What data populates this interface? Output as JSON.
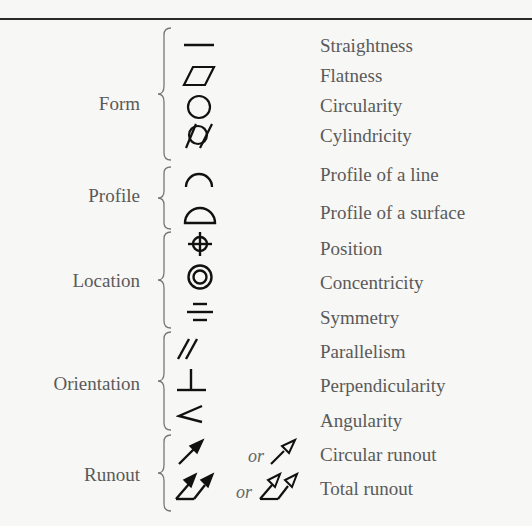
{
  "diagram": {
    "categories": [
      {
        "label": "Form",
        "items": [
          {
            "symbol": "straightness-icon",
            "name": "Straightness"
          },
          {
            "symbol": "flatness-icon",
            "name": "Flatness"
          },
          {
            "symbol": "circularity-icon",
            "name": "Circularity"
          },
          {
            "symbol": "cylindricity-icon",
            "name": "Cylindricity"
          }
        ]
      },
      {
        "label": "Profile",
        "items": [
          {
            "symbol": "profile-line-icon",
            "name": "Profile of a line"
          },
          {
            "symbol": "profile-surface-icon",
            "name": "Profile of a surface"
          }
        ]
      },
      {
        "label": "Location",
        "items": [
          {
            "symbol": "position-icon",
            "name": "Position"
          },
          {
            "symbol": "concentricity-icon",
            "name": "Concentricity"
          },
          {
            "symbol": "symmetry-icon",
            "name": "Symmetry"
          }
        ]
      },
      {
        "label": "Orientation",
        "items": [
          {
            "symbol": "parallelism-icon",
            "name": "Parallelism"
          },
          {
            "symbol": "perpendicularity-icon",
            "name": "Perpendicularity"
          },
          {
            "symbol": "angularity-icon",
            "name": "Angularity"
          }
        ]
      },
      {
        "label": "Runout",
        "items": [
          {
            "symbol": "circular-runout-icon",
            "alt_symbol": "circular-runout-open-icon",
            "or_label": "or",
            "name": "Circular runout"
          },
          {
            "symbol": "total-runout-icon",
            "alt_symbol": "total-runout-open-icon",
            "or_label": "or",
            "name": "Total runout"
          }
        ]
      }
    ]
  },
  "colors": {
    "background": "#f7f7f5",
    "text": "#5a5a5a",
    "symbol": "#111111",
    "brace": "#777777"
  }
}
